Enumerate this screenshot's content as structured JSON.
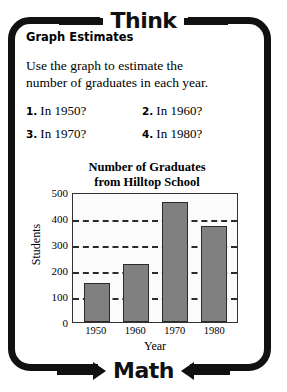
{
  "banner": {
    "top_label": "Think",
    "bottom_label": "Math",
    "arrow_right_icon": "arrow-right-icon",
    "arrow_left_icon": "arrow-left-icon"
  },
  "lesson": {
    "section_heading": "Graph Estimates",
    "prompt_line1": "Use the graph to estimate the",
    "prompt_line2": "number of graduates in each year.",
    "questions": [
      {
        "number": "1.",
        "text": "In 1950?"
      },
      {
        "number": "2.",
        "text": "In 1960?"
      },
      {
        "number": "3.",
        "text": "In 1970?"
      },
      {
        "number": "4.",
        "text": "In 1980?"
      }
    ]
  },
  "chart_data": {
    "type": "bar",
    "title": "Number of Graduates from Hilltop School",
    "title_line1": "Number of Graduates",
    "title_line2": "from Hilltop School",
    "xlabel": "Year",
    "ylabel": "Students",
    "categories": [
      "1950",
      "1960",
      "1970",
      "1980"
    ],
    "values": [
      150,
      225,
      460,
      370
    ],
    "ylim": [
      0,
      500
    ],
    "yticks": [
      0,
      100,
      200,
      300,
      400,
      500
    ],
    "ytick_labels": [
      "0",
      "100",
      "200",
      "300",
      "400",
      "500"
    ],
    "gridlines": [
      100,
      200,
      300,
      400
    ],
    "grid": "horizontal-dashed",
    "legend": "none",
    "bar_color": "#808080",
    "bar_edge_color": "#2b2b2b",
    "plot_background": "#fbfbfb"
  }
}
